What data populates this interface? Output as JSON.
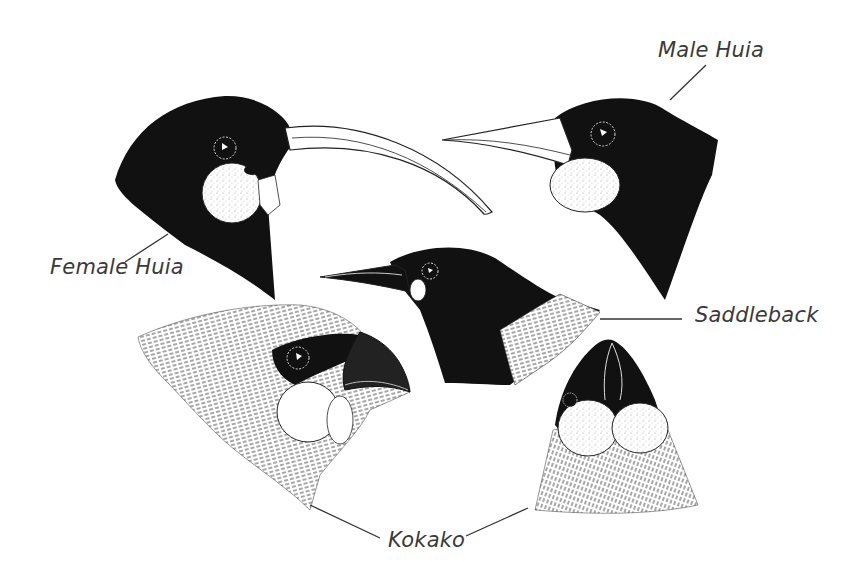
{
  "figure": {
    "background": "#ffffff",
    "ink_color": "#111111",
    "label_color": "#3a3a3a",
    "labels": {
      "female_huia": "Female Huia",
      "male_huia": "Male Huia",
      "saddleback": "Saddleback",
      "kokako": "Kokako"
    },
    "subjects": [
      {
        "name": "Female Huia",
        "view": "side",
        "features": [
          "black head",
          "long curved pale bill",
          "white wattle"
        ]
      },
      {
        "name": "Male Huia",
        "view": "side",
        "features": [
          "black head",
          "short straight pale bill",
          "white wattle"
        ]
      },
      {
        "name": "Saddleback",
        "view": "side",
        "features": [
          "black head",
          "pointed bill",
          "small pale wattle",
          "hatched saddle"
        ]
      },
      {
        "name": "Kokako",
        "view": "side",
        "features": [
          "hatched grey plumage",
          "black mask",
          "stout hooked bill",
          "large round wattle"
        ]
      },
      {
        "name": "Kokako",
        "view": "front",
        "features": [
          "black face",
          "paired round wattles",
          "hatched breast"
        ]
      }
    ]
  }
}
